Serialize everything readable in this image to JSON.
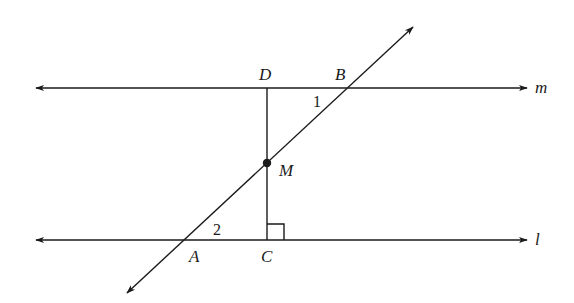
{
  "diagram": {
    "lines": {
      "m": {
        "label": "m",
        "y": 88,
        "x1": 36,
        "x2": 527
      },
      "l": {
        "label": "l",
        "y": 240,
        "x1": 36,
        "x2": 527
      }
    },
    "transversal": {
      "x1": 413,
      "y1": 27,
      "x2": 127,
      "y2": 293
    },
    "perpendicular": {
      "x": 267,
      "y1": 88,
      "y2": 240
    },
    "points": {
      "D": {
        "label": "D",
        "x": 267,
        "y": 88
      },
      "B": {
        "label": "B",
        "x": 350,
        "y": 88
      },
      "M": {
        "label": "M",
        "x": 267,
        "y": 163
      },
      "A": {
        "label": "A",
        "x": 183,
        "y": 240
      },
      "C": {
        "label": "C",
        "x": 267,
        "y": 240
      }
    },
    "angles": {
      "angle1": {
        "label": "1"
      },
      "angle2": {
        "label": "2"
      }
    },
    "right_angle_marker": {
      "at": "C",
      "size": 16
    },
    "colors": {
      "ink": "#1a1a1a",
      "background": "#ffffff"
    }
  }
}
